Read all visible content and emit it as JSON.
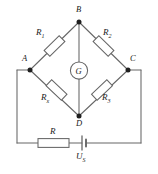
{
  "figure": {
    "kind": "circuit-diagram",
    "name": "wheatstone-bridge",
    "background_color": "#ffffff",
    "line_color": "#555555",
    "text_color": "#1a1a1a"
  },
  "nodes": [
    {
      "id": "B",
      "label": "B",
      "x": 79,
      "y": 22,
      "label_x": 76,
      "label_y": 7
    },
    {
      "id": "A",
      "label": "A",
      "x": 30,
      "y": 70,
      "label_x": 23,
      "label_y": 56
    },
    {
      "id": "C",
      "label": "C",
      "x": 128,
      "y": 70,
      "label_x": 130,
      "label_y": 56
    },
    {
      "id": "D",
      "label": "D",
      "x": 79,
      "y": 116,
      "label_x": 76,
      "label_y": 119
    }
  ],
  "components": [
    {
      "id": "R1",
      "kind": "resistor",
      "symbol": "rectangle",
      "label": "R",
      "subscript": "1",
      "branch": "A-B",
      "label_x": 39,
      "label_y": 31
    },
    {
      "id": "R2",
      "kind": "resistor",
      "symbol": "rectangle",
      "label": "R",
      "subscript": "2",
      "branch": "B-C",
      "label_x": 106,
      "label_y": 31
    },
    {
      "id": "Rx",
      "kind": "resistor",
      "symbol": "rectangle",
      "label": "R",
      "subscript": "x",
      "branch": "A-D",
      "label_x": 43,
      "label_y": 96
    },
    {
      "id": "R3",
      "kind": "resistor",
      "symbol": "rectangle",
      "label": "R",
      "subscript": "3",
      "branch": "D-C",
      "label_x": 104,
      "label_y": 96
    },
    {
      "id": "G",
      "kind": "galvanometer",
      "symbol": "circle",
      "label": "G",
      "branch": "B-D",
      "label_x": 76,
      "label_y": 65
    },
    {
      "id": "R",
      "kind": "resistor",
      "symbol": "rectangle",
      "label": "R",
      "subscript": "",
      "branch": "bottom-loop",
      "label_x": 45,
      "label_y": 130
    },
    {
      "id": "Us",
      "kind": "battery",
      "symbol": "cell",
      "label": "U",
      "subscript": "S",
      "branch": "bottom-loop",
      "label_x": 79,
      "label_y": 155
    }
  ],
  "wires": [
    {
      "from": "A",
      "to": "B",
      "through": "R1"
    },
    {
      "from": "B",
      "to": "C",
      "through": "R2"
    },
    {
      "from": "A",
      "to": "D",
      "through": "Rx"
    },
    {
      "from": "D",
      "to": "C",
      "through": "R3"
    },
    {
      "from": "B",
      "to": "D",
      "through": "G"
    },
    {
      "from": "A",
      "to": "bottom-left-corner",
      "through": ""
    },
    {
      "from": "bottom-left-corner",
      "to": "R",
      "through": ""
    },
    {
      "from": "R",
      "to": "Us",
      "through": ""
    },
    {
      "from": "Us",
      "to": "bottom-right-corner",
      "through": ""
    },
    {
      "from": "bottom-right-corner",
      "to": "C",
      "through": ""
    }
  ]
}
